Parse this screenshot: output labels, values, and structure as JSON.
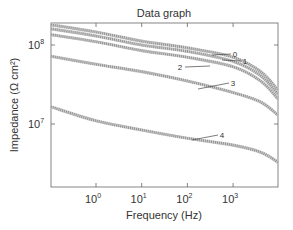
{
  "chart_data": {
    "type": "line",
    "title": "Data graph",
    "xlabel": "Frequency (Hz)",
    "ylabel": "Impedance (Ω cm²)",
    "xscale": "log",
    "yscale": "log",
    "xlim": [
      0.1,
      9500
    ],
    "ylim": [
      1600000,
      190000000
    ],
    "x_ticks": [
      {
        "value": 1,
        "label_base": "10",
        "label_exp": "0"
      },
      {
        "value": 10,
        "label_base": "10",
        "label_exp": "1"
      },
      {
        "value": 100,
        "label_base": "10",
        "label_exp": "2"
      },
      {
        "value": 1000,
        "label_base": "10",
        "label_exp": "3"
      }
    ],
    "y_ticks": [
      {
        "value": 10000000,
        "label_base": "10",
        "label_exp": "7"
      },
      {
        "value": 100000000,
        "label_base": "10",
        "label_exp": "8"
      }
    ],
    "grid": false,
    "legend": "inline curve labels",
    "x": [
      0.1,
      1,
      10,
      100,
      1000,
      4000,
      9500
    ],
    "series": [
      {
        "name": "0",
        "values": [
          180000000,
          146000000,
          112000000,
          92000000,
          70000000,
          46000000,
          27000000
        ]
      },
      {
        "name": "1",
        "values": [
          160000000,
          130000000,
          100000000,
          83000000,
          62000000,
          41000000,
          24000000
        ]
      },
      {
        "name": "2",
        "values": [
          135000000,
          110000000,
          85000000,
          70000000,
          53000000,
          35000000,
          21000000
        ]
      },
      {
        "name": "3",
        "values": [
          72000000,
          57000000,
          46000000,
          35000000,
          25000000,
          19000000,
          13000000
        ]
      },
      {
        "name": "4",
        "values": [
          16500000,
          11000000,
          8400000,
          6600000,
          5400000,
          4400000,
          3300000
        ]
      }
    ],
    "annotations": [
      {
        "text": "0",
        "x_px": 235,
        "y_px": 57,
        "line_from": [
          212,
          55
        ]
      },
      {
        "text": "1",
        "x_px": 245,
        "y_px": 64,
        "line_from": [
          222,
          60
        ]
      },
      {
        "text": "2",
        "x_px": 180,
        "y_px": 70,
        "line_to": [
          210,
          66
        ]
      },
      {
        "text": "3",
        "x_px": 233,
        "y_px": 86,
        "line_from": [
          198,
          89
        ]
      },
      {
        "text": "4",
        "x_px": 222,
        "y_px": 138,
        "line_from": [
          192,
          140
        ]
      }
    ]
  },
  "colors": {
    "axis": "#666666",
    "curve": "#888888",
    "text": "#333333"
  }
}
